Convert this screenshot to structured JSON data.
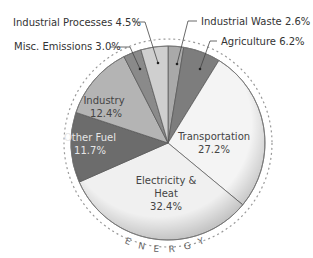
{
  "chart_data": {
    "type": "pie",
    "title": "",
    "arc_label": "ENERGY",
    "start_angle_deg": 0,
    "direction": "clockwise",
    "categories": [
      "Industrial Waste",
      "Agriculture",
      "Transportation",
      "Electricity & Heat",
      "Other Fuel",
      "Industry",
      "Misc. Emissions",
      "Industrial Processes"
    ],
    "values": [
      2.6,
      6.2,
      27.2,
      32.4,
      11.7,
      12.4,
      3.0,
      4.5
    ],
    "unit": "%",
    "slices": [
      {
        "name": "Industrial Waste",
        "value": 2.6,
        "label": "Industrial Waste 2.6%",
        "color": "#a9a9a9",
        "label_position": "outside"
      },
      {
        "name": "Agriculture",
        "value": 6.2,
        "label": "Agriculture 6.2%",
        "color": "#7d7d7d",
        "label_position": "outside"
      },
      {
        "name": "Transportation",
        "value": 27.2,
        "label_line1": "Transportation",
        "label_line2": "27.2%",
        "color": "#f4f4f4",
        "label_position": "inside"
      },
      {
        "name": "Electricity & Heat",
        "value": 32.4,
        "label_line1": "Electricity &",
        "label_line2": "Heat",
        "label_line3": "32.4%",
        "color": "#f0f0f0",
        "label_position": "inside"
      },
      {
        "name": "Other Fuel",
        "value": 11.7,
        "label_line1": "Other Fuel",
        "label_line2": "11.7%",
        "color": "#6c6c6c",
        "label_position": "inside"
      },
      {
        "name": "Industry",
        "value": 12.4,
        "label_line1": "Industry",
        "label_line2": "12.4%",
        "color": "#b4b4b4",
        "label_position": "inside"
      },
      {
        "name": "Misc. Emissions",
        "value": 3.0,
        "label": "Misc. Emissions 3.0%",
        "color": "#8a8a8a",
        "label_position": "outside"
      },
      {
        "name": "Industrial Processes",
        "value": 4.5,
        "label": "Industrial Processes 4.5%",
        "color": "#cfcfcf",
        "label_position": "outside"
      }
    ],
    "legend": "none"
  },
  "labels": {
    "industrial_processes": "Industrial Processes 4.5%",
    "misc_emissions": "Misc. Emissions 3.0%",
    "industrial_waste": "Industrial Waste 2.6%",
    "agriculture": "Agriculture 6.2%",
    "industry_name": "Industry",
    "industry_value": "12.4%",
    "other_fuel_name": "Other Fuel",
    "other_fuel_value": "11.7%",
    "transportation_name": "Transportation",
    "transportation_value": "27.2%",
    "electricity_line1": "Electricity &",
    "electricity_line2": "Heat",
    "electricity_value": "32.4%",
    "energy_letters": [
      "E",
      "N",
      "E",
      "R",
      "G",
      "Y"
    ]
  }
}
